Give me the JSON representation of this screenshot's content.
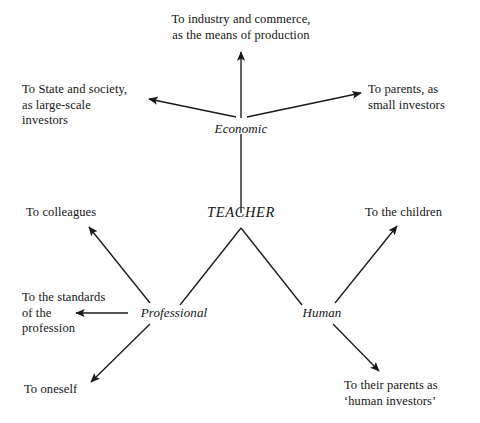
{
  "diagram": {
    "type": "radial-relationship-diagram",
    "title_center": "TEACHER",
    "background_color": "#ffffff",
    "line_color": "#1a1a1a",
    "nodes": {
      "teacher": "TEACHER",
      "economic": "Economic",
      "professional": "Professional",
      "human": "Human"
    },
    "leaves": {
      "industry": "To industry and commerce,\nas the means of production",
      "state": "To State and society,\nas large-scale\ninvestors",
      "parents_small": "To parents, as\nsmall investors",
      "colleagues": "To colleagues",
      "children": "To the children",
      "standards": "To the standards\nof the\nprofession",
      "oneself": "To oneself",
      "parents_human": "To their parents as\n‘human investors’"
    },
    "edges": [
      {
        "from": "teacher",
        "to": "economic",
        "arrow": false
      },
      {
        "from": "economic",
        "to": "industry",
        "arrow": true
      },
      {
        "from": "economic",
        "to": "state",
        "arrow": true
      },
      {
        "from": "economic",
        "to": "parents_small",
        "arrow": true
      },
      {
        "from": "teacher",
        "to": "professional",
        "arrow": false
      },
      {
        "from": "teacher",
        "to": "human",
        "arrow": false
      },
      {
        "from": "professional",
        "to": "colleagues",
        "arrow": true
      },
      {
        "from": "professional",
        "to": "standards",
        "arrow": true
      },
      {
        "from": "professional",
        "to": "oneself",
        "arrow": true
      },
      {
        "from": "human",
        "to": "children",
        "arrow": true
      },
      {
        "from": "human",
        "to": "parents_human",
        "arrow": true
      }
    ]
  }
}
